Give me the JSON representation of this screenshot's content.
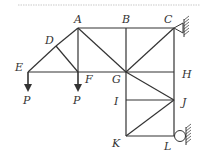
{
  "diagram": {
    "type": "truss",
    "nodes": {
      "A": {
        "label": "A",
        "x": 78,
        "y": 28
      },
      "B": {
        "label": "B",
        "x": 126,
        "y": 28
      },
      "C": {
        "label": "C",
        "x": 174,
        "y": 28
      },
      "D": {
        "label": "D",
        "x": 56,
        "y": 46
      },
      "E": {
        "label": "E",
        "x": 28,
        "y": 72
      },
      "F": {
        "label": "F",
        "x": 78,
        "y": 72
      },
      "G": {
        "label": "G",
        "x": 126,
        "y": 72
      },
      "H": {
        "label": "H",
        "x": 174,
        "y": 72
      },
      "I": {
        "label": "I",
        "x": 126,
        "y": 100
      },
      "J": {
        "label": "J",
        "x": 174,
        "y": 100
      },
      "K": {
        "label": "K",
        "x": 126,
        "y": 136
      },
      "L": {
        "label": "L",
        "x": 174,
        "y": 136
      }
    },
    "members": [
      [
        "A",
        "B"
      ],
      [
        "B",
        "C"
      ],
      [
        "E",
        "F"
      ],
      [
        "F",
        "G"
      ],
      [
        "G",
        "H"
      ],
      [
        "E",
        "D"
      ],
      [
        "D",
        "A"
      ],
      [
        "D",
        "F"
      ],
      [
        "A",
        "F"
      ],
      [
        "A",
        "G"
      ],
      [
        "B",
        "G"
      ],
      [
        "G",
        "C"
      ],
      [
        "C",
        "H"
      ],
      [
        "G",
        "I"
      ],
      [
        "I",
        "K"
      ],
      [
        "H",
        "J"
      ],
      [
        "J",
        "L"
      ],
      [
        "I",
        "J"
      ],
      [
        "G",
        "J"
      ],
      [
        "K",
        "J"
      ],
      [
        "K",
        "L"
      ]
    ],
    "loads": [
      {
        "node": "E",
        "label": "P",
        "direction": "down"
      },
      {
        "node": "F",
        "label": "P",
        "direction": "down"
      }
    ],
    "supports": [
      {
        "node": "C",
        "type": "pin",
        "side": "right"
      },
      {
        "node": "L",
        "type": "roller",
        "side": "right"
      }
    ]
  }
}
